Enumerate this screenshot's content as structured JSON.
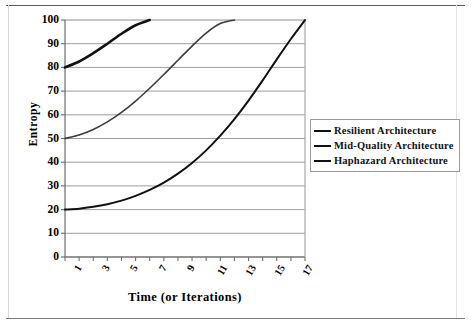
{
  "chart_data": {
    "type": "line",
    "title": "",
    "xlabel": "Time (or Iterations)",
    "ylabel": "Entropy",
    "xlim": [
      1,
      18
    ],
    "ylim": [
      0,
      100
    ],
    "grid": true,
    "legend_position": "right",
    "y_ticks": [
      "0",
      "10",
      "20",
      "30",
      "40",
      "50",
      "60",
      "70",
      "80",
      "90",
      "100"
    ],
    "x_ticks": [
      "1",
      "3",
      "5",
      "7",
      "9",
      "11",
      "13",
      "15",
      "17"
    ],
    "x_all": [
      1,
      2,
      3,
      4,
      5,
      6,
      7,
      8,
      9,
      10,
      11,
      12,
      13,
      14,
      15,
      16,
      17,
      18
    ],
    "series": [
      {
        "name": "Resilient Architecture",
        "color": "#111111",
        "width": 2.0,
        "values": [
          20,
          20.4,
          21.2,
          22.3,
          23.8,
          25.8,
          28.3,
          31.4,
          35.2,
          39.7,
          45.0,
          51.2,
          58.2,
          66.0,
          74.5,
          83.4,
          92.0,
          100
        ]
      },
      {
        "name": "Mid-Quality Architecture",
        "color": "#3c3c3c",
        "width": 1.6,
        "values": [
          50,
          51.5,
          53.8,
          57.0,
          61.0,
          65.8,
          71.2,
          77.0,
          83.0,
          89.0,
          94.5,
          98.5,
          100,
          null,
          null,
          null,
          null,
          null
        ]
      },
      {
        "name": "Haphazard Architecture",
        "color": "#111111",
        "width": 2.6,
        "values": [
          80,
          82.5,
          86.0,
          90.0,
          94.2,
          97.8,
          100,
          null,
          null,
          null,
          null,
          null,
          null,
          null,
          null,
          null,
          null,
          null
        ]
      }
    ]
  },
  "legend": {
    "items": [
      {
        "label": "Resilient Architecture"
      },
      {
        "label": "Mid-Quality Architecture"
      },
      {
        "label": "Haphazard Architecture"
      }
    ]
  }
}
